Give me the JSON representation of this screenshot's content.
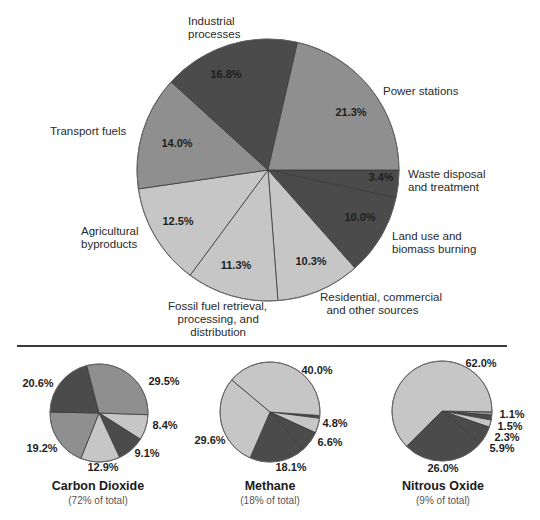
{
  "colors": {
    "dark": "#4b4b4b",
    "mid": "#8f8f8f",
    "light": "#c6c6c6",
    "edge": "#3a3a3a"
  },
  "chart_data": [
    {
      "type": "pie",
      "title": "Greenhouse gas emissions by sector",
      "center": [
        268,
        170
      ],
      "radius": 131,
      "start_angle_deg": 0,
      "direction": "clockwise",
      "slices": [
        {
          "label": "Waste disposal and treatment",
          "value": 3.4,
          "pct": "3.4%",
          "shade": "dark"
        },
        {
          "label": "Land use and biomass burning",
          "value": 10.0,
          "pct": "10.0%",
          "shade": "dark"
        },
        {
          "label": "Residential, commercial and other sources",
          "value": 10.3,
          "pct": "10.3%",
          "shade": "light"
        },
        {
          "label": "Fossil fuel retrieval, processing, and distribution",
          "value": 11.3,
          "pct": "11.3%",
          "shade": "light"
        },
        {
          "label": "Agricultural byproducts",
          "value": 12.5,
          "pct": "12.5%",
          "shade": "light"
        },
        {
          "label": "Transport fuels",
          "value": 14.0,
          "pct": "14.0%",
          "shade": "mid"
        },
        {
          "label": "Industrial processes",
          "value": 16.8,
          "pct": "16.8%",
          "shade": "dark"
        },
        {
          "label": "Power stations",
          "value": 21.3,
          "pct": "21.3%",
          "shade": "mid"
        }
      ]
    },
    {
      "type": "pie",
      "title": "Carbon Dioxide",
      "subtitle": "(72% of total)",
      "center": [
        99,
        413
      ],
      "radius": 49,
      "start_angle_deg": 2,
      "direction": "clockwise",
      "slices": [
        {
          "value": 8.4,
          "pct": "8.4%",
          "shade": "light"
        },
        {
          "value": 9.1,
          "pct": "9.1%",
          "shade": "dark"
        },
        {
          "value": 12.9,
          "pct": "12.9%",
          "shade": "light"
        },
        {
          "value": 19.2,
          "pct": "19.2%",
          "shade": "mid"
        },
        {
          "value": 20.6,
          "pct": "20.6%",
          "shade": "dark"
        },
        {
          "value": 29.5,
          "pct": "29.5%",
          "shade": "mid"
        }
      ]
    },
    {
      "type": "pie",
      "title": "Methane",
      "subtitle": "(18% of total)",
      "center": [
        270,
        412
      ],
      "radius": 50,
      "start_angle_deg": 4,
      "direction": "clockwise",
      "slices": [
        {
          "value": 0.9,
          "pct": "",
          "shade": "dark"
        },
        {
          "value": 4.8,
          "pct": "4.8%",
          "shade": "light"
        },
        {
          "value": 6.6,
          "pct": "6.6%",
          "shade": "dark"
        },
        {
          "value": 18.1,
          "pct": "18.1%",
          "shade": "dark"
        },
        {
          "value": 29.6,
          "pct": "29.6%",
          "shade": "light"
        },
        {
          "value": 40.0,
          "pct": "40.0%",
          "shade": "light"
        }
      ]
    },
    {
      "type": "pie",
      "title": "Nitrous Oxide",
      "subtitle": "(9% of total)",
      "center": [
        442,
        411
      ],
      "radius": 50,
      "start_angle_deg": 1,
      "direction": "clockwise",
      "slices": [
        {
          "value": 1.1,
          "pct": "1.1%",
          "shade": "mid"
        },
        {
          "value": 1.5,
          "pct": "1.5%",
          "shade": "dark"
        },
        {
          "value": 2.3,
          "pct": "2.3%",
          "shade": "light"
        },
        {
          "value": 5.9,
          "pct": "5.9%",
          "shade": "dark"
        },
        {
          "value": 26.0,
          "pct": "26.0%",
          "shade": "dark"
        },
        {
          "value": 62.0,
          "pct": "62.0%",
          "shade": "light"
        }
      ]
    }
  ],
  "main": {
    "labels": {
      "industrial": "Industrial\nprocesses",
      "power": "Power stations",
      "waste": "Waste disposal\nand treatment",
      "land": "Land use and\nbiomass burning",
      "residential": "Residential, commercial\n  and other sources",
      "fossil": "Fossil fuel retrieval,\n   processing, and\n       distribution",
      "agricultural": "Agricultural\nbyproducts",
      "transport": "Transport fuels"
    },
    "pcts": {
      "industrial": "16.8%",
      "power": "21.3%",
      "waste": "3.4%",
      "land": "10.0%",
      "residential": "10.3%",
      "fossil": "11.3%",
      "agricultural": "12.5%",
      "transport": "14.0%"
    }
  },
  "small": {
    "co2": {
      "title": "Carbon Dioxide",
      "note": "(72% of total)",
      "p1": "29.5%",
      "p2": "8.4%",
      "p3": "9.1%",
      "p4": "12.9%",
      "p5": "19.2%",
      "p6": "20.6%"
    },
    "ch4": {
      "title": "Methane",
      "note": "(18% of total)",
      "p1": "40.0%",
      "p2": "4.8%",
      "p3": "6.6%",
      "p4": "18.1%",
      "p5": "29.6%"
    },
    "n2o": {
      "title": "Nitrous Oxide",
      "note": "(9% of total)",
      "p1": "62.0%",
      "p2": "1.1%",
      "p3": "1.5%",
      "p4": "2.3%",
      "p5": "5.9%",
      "p6": "26.0%"
    }
  }
}
